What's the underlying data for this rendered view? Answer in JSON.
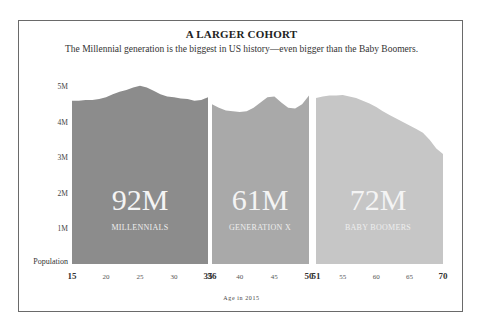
{
  "chart_data": {
    "type": "area",
    "title": "A LARGER COHORT",
    "subtitle": "The Millennial generation is the biggest in US history—even bigger than the Baby Boomers.",
    "xlabel": "Age in 2015",
    "ylabel": "Population",
    "y_ticks": [
      "5M",
      "4M",
      "3M",
      "2M",
      "1M"
    ],
    "ylim": [
      0,
      5000000
    ],
    "grid": false,
    "x_ticks": [
      {
        "label": "15",
        "bold": true
      },
      {
        "label": "20",
        "bold": false
      },
      {
        "label": "25",
        "bold": false
      },
      {
        "label": "30",
        "bold": false
      },
      {
        "label": "35",
        "bold": true
      },
      {
        "label": "36",
        "bold": true
      },
      {
        "label": "40",
        "bold": false
      },
      {
        "label": "45",
        "bold": false
      },
      {
        "label": "50",
        "bold": true
      },
      {
        "label": "51",
        "bold": true
      },
      {
        "label": "55",
        "bold": false
      },
      {
        "label": "60",
        "bold": false
      },
      {
        "label": "65",
        "bold": false
      },
      {
        "label": "70",
        "bold": true
      }
    ],
    "series": [
      {
        "name": "MILLENNIALS",
        "total": "92M",
        "color": "#8c8c8c",
        "x": [
          15,
          16,
          17,
          18,
          19,
          20,
          21,
          22,
          23,
          24,
          25,
          26,
          27,
          28,
          29,
          30,
          31,
          32,
          33,
          34,
          35
        ],
        "values": [
          4.6,
          4.6,
          4.62,
          4.62,
          4.65,
          4.7,
          4.78,
          4.85,
          4.9,
          4.97,
          5.02,
          4.97,
          4.88,
          4.78,
          4.72,
          4.7,
          4.66,
          4.65,
          4.6,
          4.62,
          4.7
        ]
      },
      {
        "name": "GENERATION X",
        "total": "61M",
        "color": "#a9a9a9",
        "x": [
          36,
          37,
          38,
          39,
          40,
          41,
          42,
          43,
          44,
          45,
          46,
          47,
          48,
          49,
          50
        ],
        "values": [
          4.5,
          4.4,
          4.32,
          4.3,
          4.28,
          4.3,
          4.4,
          4.55,
          4.7,
          4.72,
          4.55,
          4.4,
          4.38,
          4.5,
          4.75
        ]
      },
      {
        "name": "BABY BOOMERS",
        "total": "72M",
        "color": "#c6c6c6",
        "x": [
          51,
          52,
          53,
          54,
          55,
          56,
          57,
          58,
          59,
          60,
          61,
          62,
          63,
          64,
          65,
          66,
          67,
          68,
          69,
          70
        ],
        "values": [
          4.68,
          4.72,
          4.75,
          4.75,
          4.76,
          4.72,
          4.68,
          4.6,
          4.52,
          4.42,
          4.3,
          4.2,
          4.1,
          4.0,
          3.9,
          3.8,
          3.7,
          3.5,
          3.25,
          3.1
        ]
      }
    ]
  }
}
